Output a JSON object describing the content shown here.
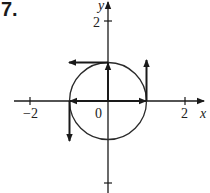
{
  "problem": {
    "number": "7."
  },
  "axes": {
    "x_label": "x",
    "y_label": "y",
    "origin_label": "0",
    "x_ticks": [
      {
        "value": -2,
        "label": "−2"
      },
      {
        "value": 2,
        "label": "2"
      }
    ],
    "y_ticks": [
      {
        "value": 2,
        "label": "2"
      },
      {
        "value": -2,
        "label": ""
      }
    ]
  },
  "circle": {
    "center": [
      0,
      0
    ],
    "radius": 1
  },
  "vectors": [
    {
      "name": "position-up",
      "from": [
        0,
        0
      ],
      "to": [
        0,
        1
      ]
    },
    {
      "name": "velocity-at-top-left",
      "from": [
        0,
        1
      ],
      "to": [
        -1,
        1
      ]
    },
    {
      "name": "position-right",
      "from": [
        0,
        0
      ],
      "to": [
        1,
        0
      ]
    },
    {
      "name": "velocity-at-right-up",
      "from": [
        1,
        0
      ],
      "to": [
        1,
        1
      ]
    },
    {
      "name": "position-left",
      "from": [
        0,
        0
      ],
      "to": [
        -1,
        0
      ]
    },
    {
      "name": "velocity-at-left-down",
      "from": [
        -1,
        0
      ],
      "to": [
        -1,
        -1
      ]
    }
  ],
  "colors": {
    "ink": "#1a1a1a"
  }
}
